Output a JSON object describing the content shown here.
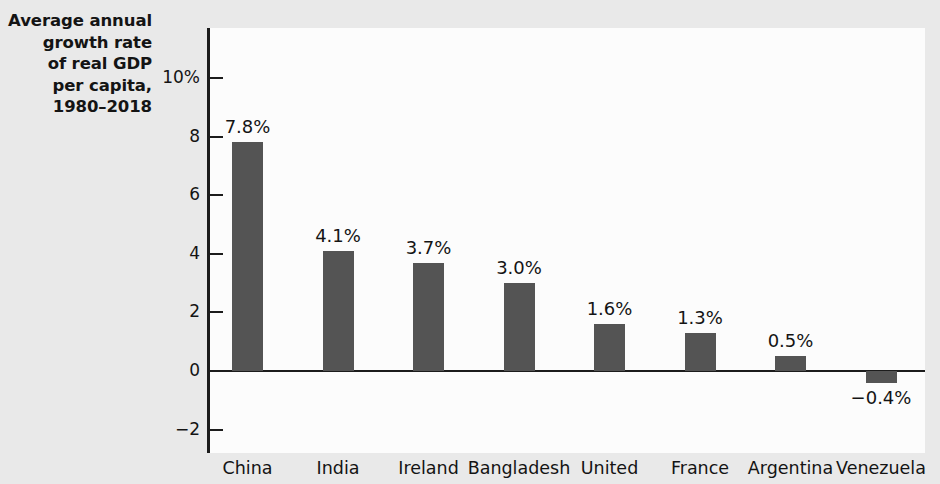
{
  "chart_data": {
    "type": "bar",
    "title": "Average annual growth rate of real GDP per capita, 1980–2018",
    "title_lines": [
      "Average annual",
      "growth rate",
      "of real GDP",
      "per capita,",
      "1980–2018"
    ],
    "xlabel": "",
    "ylabel": "",
    "ylim": [
      -2,
      10
    ],
    "yticks": [
      10,
      8,
      6,
      4,
      2,
      0,
      -2
    ],
    "ytick_labels": [
      "10%",
      "8",
      "6",
      "4",
      "2",
      "0",
      "−2"
    ],
    "grid": false,
    "legend": "none",
    "categories": [
      "China",
      "India",
      "Ireland",
      "Bangladesh",
      "United",
      "France",
      "Argentina",
      "Venezuela"
    ],
    "values": [
      7.8,
      4.1,
      3.7,
      3.0,
      1.6,
      1.3,
      0.5,
      -0.4
    ],
    "data_labels": [
      "7.8%",
      "4.1%",
      "3.7%",
      "3.0%",
      "1.6%",
      "1.3%",
      "0.5%",
      "−0.4%"
    ],
    "bar_color": "#545454",
    "axis_color": "#1c1c1c",
    "plot_background": "#fcfcfc",
    "figure_background": "#e9e9e9",
    "text_color": "#141414"
  }
}
